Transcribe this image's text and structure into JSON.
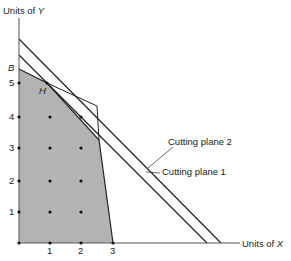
{
  "axes": {
    "y_label_prefix": "Units of ",
    "y_label_var": "Y",
    "x_label_prefix": "Units of ",
    "x_label_var": "X",
    "x_ticks": [
      "1",
      "2",
      "3"
    ],
    "y_ticks": [
      "1",
      "2",
      "3",
      "4",
      "5"
    ]
  },
  "points": {
    "B": "B",
    "H": "H"
  },
  "annotations": {
    "cutting_plane_2": "Cutting plane 2",
    "cutting_plane_1": "Cutting plane 1"
  },
  "colors": {
    "feasible_region": "#b3b3b3",
    "lines": "#222222"
  }
}
